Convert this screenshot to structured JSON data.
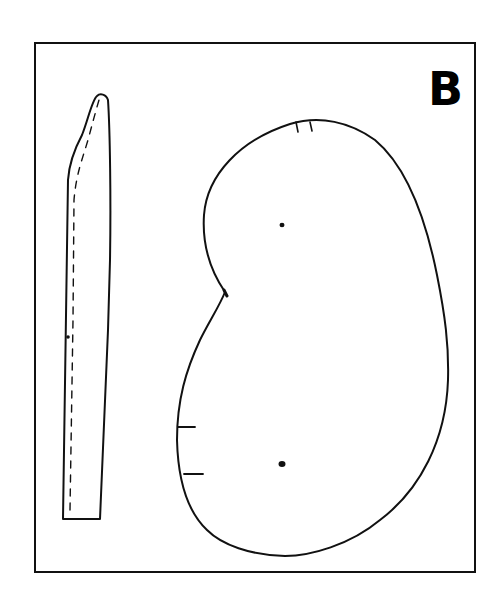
{
  "figure": {
    "panel_label": "B",
    "stroke_color": "#111111",
    "background_color": "#ffffff",
    "pieces": [
      {
        "name": "strip",
        "shape": "long narrow tapered strip with rounded top",
        "stitch_line": "dashed"
      },
      {
        "name": "kidney-piece",
        "shape": "kidney / bean-shaped outline",
        "markings": {
          "top_notches": 2,
          "left_notches": 2,
          "dots": 2,
          "waist_notch": 1
        }
      }
    ]
  }
}
